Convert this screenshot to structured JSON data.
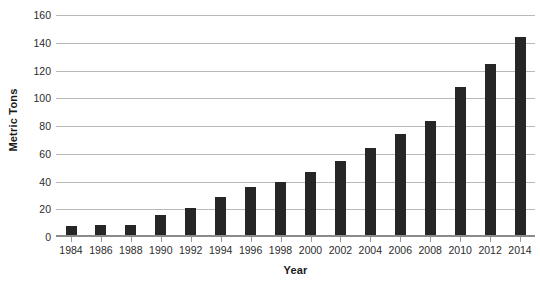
{
  "chart_data": {
    "type": "bar",
    "title": "",
    "xlabel": "Year",
    "ylabel": "Metric Tons",
    "categories": [
      "1984",
      "1986",
      "1988",
      "1990",
      "1992",
      "1994",
      "1996",
      "1998",
      "2000",
      "2002",
      "2004",
      "2006",
      "2008",
      "2010",
      "2012",
      "2014"
    ],
    "values": [
      8,
      9,
      9,
      16,
      21,
      29,
      36,
      40,
      47,
      55,
      64,
      74,
      84,
      108,
      125,
      144
    ],
    "ylim": [
      0,
      160
    ],
    "ytick_values": [
      0,
      20,
      40,
      60,
      80,
      100,
      120,
      140,
      160
    ],
    "ytick_labels": [
      "0",
      "20",
      "40",
      "60",
      "80",
      "100",
      "120",
      "140",
      "160"
    ],
    "grid": true,
    "legend": false,
    "bar_color": "#262626",
    "grid_color": "#b9b9b9",
    "axis_color": "#8a8a8a",
    "text_color": "#2b2b2b"
  }
}
